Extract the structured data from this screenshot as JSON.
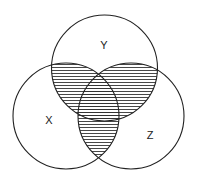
{
  "diagram": {
    "type": "venn",
    "sets": [
      {
        "id": "X",
        "label": "X",
        "cx": 66,
        "cy": 116,
        "r": 53,
        "label_x": 49,
        "label_y": 124
      },
      {
        "id": "Y",
        "label": "Y",
        "cx": 104.5,
        "cy": 68,
        "r": 53,
        "label_x": 104,
        "label_y": 49
      },
      {
        "id": "Z",
        "label": "Z",
        "cx": 131,
        "cy": 116,
        "r": 53,
        "label_x": 150,
        "label_y": 139
      }
    ],
    "shaded_regions": [
      "X∩Y",
      "Y∩Z",
      "X∩Z"
    ],
    "shading_style": "horizontal-hatch",
    "stroke_color": "#222222",
    "hatch_color": "#333333"
  }
}
